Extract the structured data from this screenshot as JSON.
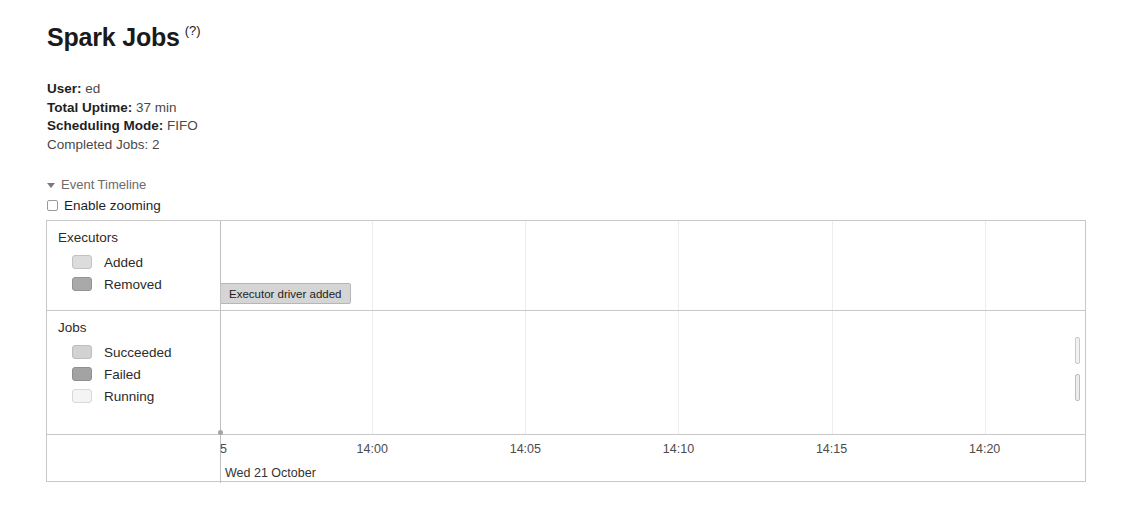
{
  "header": {
    "title": "Spark Jobs",
    "help_label": "(?)"
  },
  "summary": [
    {
      "label": "User:",
      "value": "ed",
      "bold": true
    },
    {
      "label": "Total Uptime:",
      "value": "37 min",
      "bold": true
    },
    {
      "label": "Scheduling Mode:",
      "value": "FIFO",
      "bold": true
    },
    {
      "label": "Completed Jobs:",
      "value": "2",
      "bold": false
    }
  ],
  "event_timeline": {
    "toggle_label": "Event Timeline",
    "caret_icon": "caret-down-icon",
    "enable_zooming_label": "Enable zooming",
    "enable_zooming_checked": false
  },
  "timeline": {
    "lanes": [
      {
        "name": "Executors",
        "title": "Executors",
        "legend": [
          {
            "label": "Added",
            "color": "#dcdcdc",
            "border": "#c2c2c2"
          },
          {
            "label": "Removed",
            "color": "#a9a9a9",
            "border": "#949494"
          }
        ]
      },
      {
        "name": "Jobs",
        "title": "Jobs",
        "legend": [
          {
            "label": "Succeeded",
            "color": "#d2d2d2",
            "border": "#bdbdbd"
          },
          {
            "label": "Failed",
            "color": "#a3a3a3",
            "border": "#8f8f8f"
          },
          {
            "label": "Running",
            "color": "#f4f4f4",
            "border": "#d8d8d8"
          }
        ]
      }
    ],
    "events": [
      {
        "label": "Executor driver added",
        "lane": "Executors",
        "x_pct": 0.0
      }
    ],
    "job_bars": [
      {
        "lane": "Jobs",
        "status": "Running",
        "x_pct": 98.85,
        "top_pct": 21.0,
        "height_pct": 22.0,
        "color": "#f2f2f2",
        "border": "#c9c9c9"
      },
      {
        "lane": "Jobs",
        "status": "Running",
        "x_pct": 98.85,
        "top_pct": 51.0,
        "height_pct": 22.0,
        "color": "#ededed",
        "border": "#bdbdbd"
      }
    ],
    "axis": {
      "ticks": [
        {
          "label": "13:55",
          "display": "5",
          "x_pct": 0.0,
          "clipped": true
        },
        {
          "label": "14:00",
          "display": "14:00",
          "x_pct": 17.6,
          "clipped": false
        },
        {
          "label": "14:05",
          "display": "14:05",
          "x_pct": 35.3,
          "clipped": false
        },
        {
          "label": "14:10",
          "display": "14:10",
          "x_pct": 53.0,
          "clipped": false
        },
        {
          "label": "14:15",
          "display": "14:15",
          "x_pct": 70.7,
          "clipped": false
        },
        {
          "label": "14:20",
          "display": "14:20",
          "x_pct": 88.4,
          "clipped": false
        }
      ],
      "date_label": "Wed 21 October"
    },
    "gridlines_pct": [
      0.0,
      17.6,
      35.3,
      53.0,
      70.7,
      88.4
    ]
  }
}
